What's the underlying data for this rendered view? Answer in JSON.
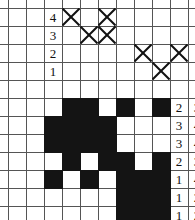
{
  "figure": {
    "type": "grid-worksheet",
    "grid": {
      "origin_x": 8,
      "origin_y": 8,
      "cell_size": 18,
      "columns": 10,
      "rows": 11,
      "line_color": "#555555",
      "fill_color": "#141414",
      "background": "#ffffff"
    },
    "left_row_labels": [
      {
        "text": "4",
        "col": 2,
        "row": 0
      },
      {
        "text": "3",
        "col": 2,
        "row": 1
      },
      {
        "text": "2",
        "col": 2,
        "row": 2
      },
      {
        "text": "1",
        "col": 2,
        "row": 3
      }
    ],
    "x_marks": [
      {
        "col": 3,
        "row": 0
      },
      {
        "col": 5,
        "row": 0
      },
      {
        "col": 4,
        "row": 1
      },
      {
        "col": 5,
        "row": 1
      },
      {
        "col": 7,
        "row": 2
      },
      {
        "col": 9,
        "row": 2
      },
      {
        "col": 8,
        "row": 3
      }
    ],
    "filled_cells": [
      {
        "col": 3,
        "row": 5
      },
      {
        "col": 4,
        "row": 5
      },
      {
        "col": 6,
        "row": 5
      },
      {
        "col": 8,
        "row": 5
      },
      {
        "col": 2,
        "row": 6
      },
      {
        "col": 3,
        "row": 6
      },
      {
        "col": 4,
        "row": 6
      },
      {
        "col": 5,
        "row": 6
      },
      {
        "col": 2,
        "row": 7
      },
      {
        "col": 3,
        "row": 7
      },
      {
        "col": 4,
        "row": 7
      },
      {
        "col": 5,
        "row": 7
      },
      {
        "col": 3,
        "row": 8
      },
      {
        "col": 5,
        "row": 8
      },
      {
        "col": 6,
        "row": 8
      },
      {
        "col": 8,
        "row": 8
      },
      {
        "col": 2,
        "row": 9
      },
      {
        "col": 4,
        "row": 9
      },
      {
        "col": 6,
        "row": 9
      },
      {
        "col": 7,
        "row": 9
      },
      {
        "col": 8,
        "row": 9
      },
      {
        "col": 6,
        "row": 10
      },
      {
        "col": 7,
        "row": 10
      },
      {
        "col": 8,
        "row": 10
      },
      {
        "col": 6,
        "row": 11
      },
      {
        "col": 7,
        "row": 11
      },
      {
        "col": 8,
        "row": 11
      },
      {
        "col": 3,
        "row": 12
      },
      {
        "col": 5,
        "row": 12
      },
      {
        "col": 6,
        "row": 12
      },
      {
        "col": 7,
        "row": 12
      }
    ],
    "right_labels": [
      {
        "row": 5,
        "first": "2",
        "second": "3"
      },
      {
        "row": 6,
        "first": "3",
        "second": "4"
      },
      {
        "row": 7,
        "first": "3",
        "second": "4"
      },
      {
        "row": 8,
        "first": "2",
        "second": "3"
      },
      {
        "row": 9,
        "first": "1",
        "second": "4"
      },
      {
        "row": 10,
        "first": "1",
        "second": "2"
      },
      {
        "row": 11,
        "first": "1",
        "second": "2"
      },
      {
        "row": 12,
        "first": "1",
        "second": "4"
      }
    ]
  }
}
